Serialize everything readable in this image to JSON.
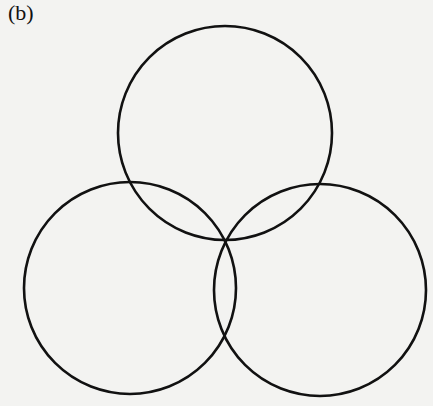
{
  "figure": {
    "label": "(b)",
    "background": "#f3f3f1",
    "stroke_color": "#111111",
    "stroke_width": 2.6,
    "circles": [
      {
        "name": "top",
        "cx": 225,
        "cy": 133,
        "r": 107
      },
      {
        "name": "bottom-left",
        "cx": 130,
        "cy": 288,
        "r": 106
      },
      {
        "name": "bottom-right",
        "cx": 320,
        "cy": 290,
        "r": 106
      }
    ],
    "common_point": {
      "x": 225,
      "y": 240
    }
  }
}
